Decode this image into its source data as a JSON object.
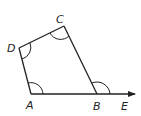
{
  "diagram": {
    "type": "geometry-quadrilateral",
    "stroke_color": "#222222",
    "points": {
      "A": {
        "label": "A",
        "x": 31,
        "y": 94
      },
      "B": {
        "label": "B",
        "x": 97,
        "y": 94
      },
      "C": {
        "label": "C",
        "x": 64,
        "y": 26
      },
      "D": {
        "label": "D",
        "x": 19,
        "y": 48
      },
      "E": {
        "label": "E",
        "x": 136,
        "y": 94
      }
    },
    "labels": {
      "A": "A",
      "B": "B",
      "C": "C",
      "D": "D",
      "E": "E"
    },
    "angle_marks": [
      "A",
      "B (exterior, CBE)",
      "C",
      "D"
    ],
    "ray": "AE through B"
  }
}
